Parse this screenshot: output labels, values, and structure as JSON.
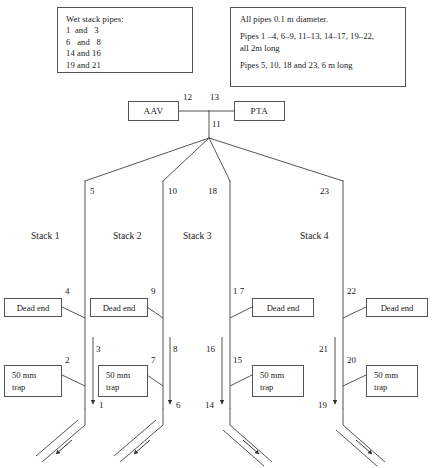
{
  "diagram": {
    "notes": {
      "wet_stack": {
        "heading": "Wet stack pipes:",
        "pairs": [
          "1  and   3",
          "6   and   8",
          "14 and 16",
          "19 and 21"
        ]
      },
      "pipe_spec": {
        "line1": "All pipes 0.1 m diameter.",
        "line2": "Pipes 1 –4, 6–9, 11–13, 14–17, 19–22,",
        "line3": "all 2m long",
        "line4": "Pipes 5, 10, 18 and 23, 6 m long"
      }
    },
    "units": {
      "aav": "AAV",
      "pta": "PTA"
    },
    "header_pipes": {
      "aav_to_junction": "12",
      "junction_to_pta": "13",
      "junction_riser": "11"
    },
    "stacks": [
      {
        "name": "Stack 1",
        "riser_label": "5",
        "dead_end_label": "Dead end",
        "dead_end_pipe": "4",
        "trap_label_line1": "50 mm",
        "trap_label_line2": "trap",
        "trap_pipe": "2",
        "wet_pipe": null,
        "outlet_label": null,
        "drain_direction": "left"
      },
      {
        "name": "Stack 2",
        "riser_label": "10",
        "dead_end_label": "Dead end",
        "dead_end_pipe": "9",
        "trap_label_line1": "50 mm",
        "trap_label_line2": "trap",
        "trap_pipe": "7",
        "wet_pipe": "3",
        "outlet_label": "1",
        "drain_direction": "left"
      },
      {
        "name": "Stack 3",
        "riser_label": "18",
        "dead_end_label": "Dead end",
        "dead_end_pipe": "1 7",
        "trap_label_line1": "50 mm",
        "trap_label_line2": "trap",
        "trap_pipe": "15",
        "wet_pipe": "16",
        "outlet_label": "14",
        "drain_direction": "right"
      },
      {
        "name": "Stack 4",
        "riser_label": "23",
        "dead_end_label": "Dead end",
        "dead_end_pipe": "22",
        "trap_label_line1": "50 mm",
        "trap_label_line2": "trap",
        "trap_pipe": "20",
        "wet_pipe": "21",
        "outlet_label": "19",
        "drain_direction": "right"
      }
    ],
    "extra_labels": {
      "stack1_riser_left_of_stack2": "5",
      "stack2_outlet_under": "6",
      "stack2_wet_outlet": "8"
    },
    "colors": {
      "line": "#555555",
      "text": "#1a1a1a",
      "background": "#ffffff"
    }
  }
}
